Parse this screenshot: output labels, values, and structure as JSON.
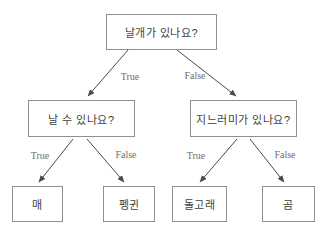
{
  "diagram": {
    "kind": "decision-tree",
    "nodes": {
      "root": {
        "label": "날개가 있나요?"
      },
      "can_fly": {
        "label": "날 수 있나요?"
      },
      "has_fins": {
        "label": "지느러미가 있나요?"
      },
      "hawk": {
        "label": "매"
      },
      "penguin": {
        "label": "펭귄"
      },
      "dolphin": {
        "label": "돌고래"
      },
      "bear": {
        "label": "곰"
      }
    },
    "edges": {
      "root_true": {
        "label": "True"
      },
      "root_false": {
        "label": "False"
      },
      "fly_true": {
        "label": "True"
      },
      "fly_false": {
        "label": "False"
      },
      "fins_true": {
        "label": "True"
      },
      "fins_false": {
        "label": "False"
      }
    },
    "colors": {
      "background": "#ffffff",
      "line": "#4a4a4a",
      "box_border": "#8f8f8f",
      "node_text": "#3f3f3f",
      "edge_label": "#6e6e6e"
    }
  }
}
